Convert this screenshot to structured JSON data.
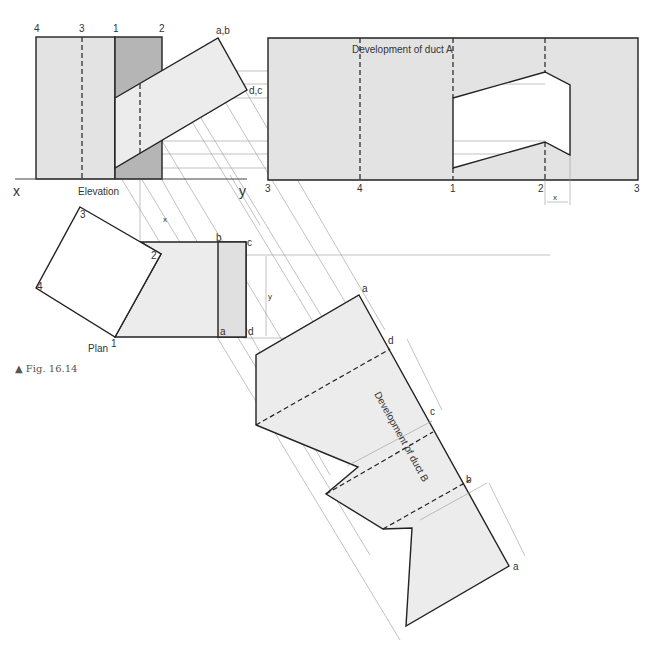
{
  "figure": {
    "caption": "▲ Fig. 16.14",
    "elevation": {
      "title": "Elevation",
      "x_label": "x",
      "y_label": "y",
      "duct_a_top_labels": [
        "4",
        "3",
        "1",
        "2"
      ],
      "duct_b_labels": [
        "a,b",
        "d,c"
      ]
    },
    "development_a": {
      "title": "Development of duct A",
      "bottom_labels": [
        "3",
        "4",
        "1",
        "2",
        "3"
      ],
      "dimension": "x"
    },
    "plan": {
      "title": "Plan",
      "square_labels": [
        "1",
        "2",
        "3",
        "4"
      ],
      "rect_labels": [
        "b",
        "c",
        "a",
        "d"
      ],
      "dimension_x": "x",
      "dimension_y": "y"
    },
    "development_b": {
      "title": "Development of duct B",
      "edge_labels": [
        "a",
        "d",
        "c",
        "b",
        "a"
      ],
      "dimension": "y"
    }
  },
  "colors": {
    "light_fill": "#e3e3e3",
    "mid_fill": "#b5b5b5",
    "plan_fill": "#ececec",
    "line": "#222222",
    "construction": "#999999"
  }
}
